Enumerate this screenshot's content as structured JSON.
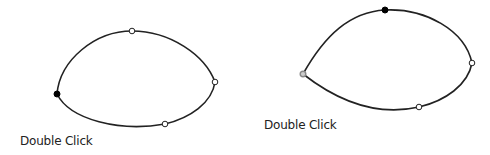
{
  "panels": [
    {
      "caption": "Double Click",
      "caption_pos": [
        20,
        134
      ],
      "path": "M57,94 C60,60 95,31 132,31 C170,31 205,55 215,82 C212,103 190,118 165,124 C120,132 70,120 57,94 Z",
      "points": [
        {
          "x": 57,
          "y": 94,
          "type": "selected-smooth"
        },
        {
          "x": 132,
          "y": 31,
          "type": "open"
        },
        {
          "x": 215,
          "y": 82,
          "type": "open"
        },
        {
          "x": 165,
          "y": 124,
          "type": "open"
        }
      ]
    },
    {
      "caption": "Double Click",
      "caption_pos": [
        264,
        118
      ],
      "path": "M303,74 C325,35 350,12 385,10 C425,8 465,30 472,63 C468,85 445,101 419,107 C375,117 335,99 303,74 Z",
      "points": [
        {
          "x": 303,
          "y": 74,
          "type": "corner"
        },
        {
          "x": 385,
          "y": 10,
          "type": "selected-smooth"
        },
        {
          "x": 472,
          "y": 63,
          "type": "open"
        },
        {
          "x": 419,
          "y": 107,
          "type": "open"
        }
      ]
    }
  ],
  "colors": {
    "stroke": "#222222",
    "fill_selected": "#000000",
    "fill_open": "#ffffff",
    "corner": "#888888"
  }
}
